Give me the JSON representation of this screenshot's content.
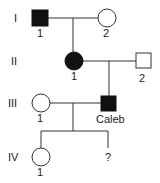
{
  "generations": [
    {
      "label": "I"
    },
    {
      "label": "II"
    },
    {
      "label": "III"
    },
    {
      "label": "IV"
    }
  ],
  "individuals": {
    "I1": {
      "label": "1",
      "sex": "male",
      "affected": true
    },
    "I2": {
      "label": "2",
      "sex": "female",
      "affected": false
    },
    "II1": {
      "label": "1",
      "sex": "female",
      "affected": true
    },
    "II2": {
      "label": "2",
      "sex": "male",
      "affected": false
    },
    "III1": {
      "label": "1",
      "sex": "female",
      "affected": false
    },
    "III2": {
      "label": "Caleb",
      "sex": "male",
      "affected": true
    },
    "IV1": {
      "label": "1",
      "sex": "female",
      "affected": false
    },
    "IV2": {
      "label": "?",
      "sex": "unknown",
      "affected": false
    }
  },
  "colors": {
    "line": "#333333",
    "affected": "#111111",
    "unaffected": "#ffffff"
  }
}
